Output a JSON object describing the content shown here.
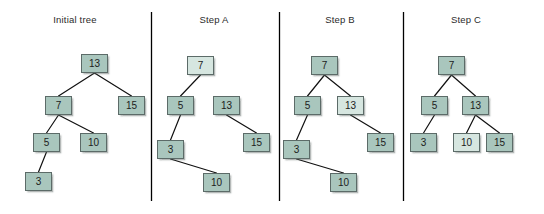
{
  "diagram": {
    "background_color": "#ffffff",
    "node_fill": "#a9c6bd",
    "node_fill_highlight": "#d6e6e0",
    "node_border": "#5c6b68",
    "edge_color": "#111111",
    "divider_color": "#000000",
    "text_color": "#2b2b2b"
  },
  "dividers": [
    {
      "x": 151,
      "y1": 12,
      "y2": 201
    },
    {
      "x": 279,
      "y1": 12,
      "y2": 201
    },
    {
      "x": 403,
      "y1": 12,
      "y2": 201
    }
  ],
  "panels": [
    {
      "id": "initial-tree",
      "title": "Initial tree",
      "title_x": 75,
      "title_y": 14,
      "nodes": [
        {
          "id": "n13",
          "label": "13",
          "x": 81,
          "y": 54,
          "highlight": false
        },
        {
          "id": "n7",
          "label": "7",
          "x": 45,
          "y": 96,
          "highlight": false
        },
        {
          "id": "n15",
          "label": "15",
          "x": 118,
          "y": 96,
          "highlight": false
        },
        {
          "id": "n5",
          "label": "5",
          "x": 33,
          "y": 133,
          "highlight": false
        },
        {
          "id": "n10",
          "label": "10",
          "x": 80,
          "y": 133,
          "highlight": false
        },
        {
          "id": "n3",
          "label": "3",
          "x": 25,
          "y": 172,
          "highlight": false
        }
      ],
      "edges": [
        {
          "from": "n13",
          "to": "n7"
        },
        {
          "from": "n13",
          "to": "n15"
        },
        {
          "from": "n7",
          "to": "n5"
        },
        {
          "from": "n7",
          "to": "n10"
        },
        {
          "from": "n5",
          "to": "n3"
        }
      ]
    },
    {
      "id": "step-a",
      "title": "Step A",
      "title_x": 214,
      "title_y": 14,
      "nodes": [
        {
          "id": "n7",
          "label": "7",
          "x": 187,
          "y": 56,
          "highlight": true
        },
        {
          "id": "n5",
          "label": "5",
          "x": 167,
          "y": 96,
          "highlight": false
        },
        {
          "id": "n13",
          "label": "13",
          "x": 213,
          "y": 96,
          "highlight": false
        },
        {
          "id": "n3",
          "label": "3",
          "x": 157,
          "y": 140,
          "highlight": false
        },
        {
          "id": "n15",
          "label": "15",
          "x": 243,
          "y": 133,
          "highlight": false
        },
        {
          "id": "n10",
          "label": "10",
          "x": 203,
          "y": 173,
          "highlight": false
        }
      ],
      "edges": [
        {
          "from": "n7",
          "to": "n5"
        },
        {
          "from": "n5",
          "to": "n3"
        },
        {
          "from": "n13",
          "to": "n15"
        },
        {
          "from": "n3",
          "to": "n10"
        }
      ]
    },
    {
      "id": "step-b",
      "title": "Step B",
      "title_x": 340,
      "title_y": 14,
      "nodes": [
        {
          "id": "n7",
          "label": "7",
          "x": 311,
          "y": 56,
          "highlight": false
        },
        {
          "id": "n5",
          "label": "5",
          "x": 294,
          "y": 96,
          "highlight": false
        },
        {
          "id": "n13",
          "label": "13",
          "x": 337,
          "y": 96,
          "highlight": true
        },
        {
          "id": "n3",
          "label": "3",
          "x": 283,
          "y": 140,
          "highlight": false
        },
        {
          "id": "n15",
          "label": "15",
          "x": 367,
          "y": 133,
          "highlight": false
        },
        {
          "id": "n10",
          "label": "10",
          "x": 330,
          "y": 173,
          "highlight": false
        }
      ],
      "edges": [
        {
          "from": "n7",
          "to": "n5"
        },
        {
          "from": "n7",
          "to": "n13"
        },
        {
          "from": "n5",
          "to": "n3"
        },
        {
          "from": "n13",
          "to": "n15"
        },
        {
          "from": "n3",
          "to": "n10"
        }
      ]
    },
    {
      "id": "step-c",
      "title": "Step C",
      "title_x": 466,
      "title_y": 14,
      "nodes": [
        {
          "id": "n7",
          "label": "7",
          "x": 438,
          "y": 56,
          "highlight": false
        },
        {
          "id": "n5",
          "label": "5",
          "x": 421,
          "y": 96,
          "highlight": false
        },
        {
          "id": "n13",
          "label": "13",
          "x": 462,
          "y": 96,
          "highlight": false
        },
        {
          "id": "n3",
          "label": "3",
          "x": 410,
          "y": 133,
          "highlight": false
        },
        {
          "id": "n10",
          "label": "10",
          "x": 453,
          "y": 133,
          "highlight": true
        },
        {
          "id": "n15",
          "label": "15",
          "x": 486,
          "y": 133,
          "highlight": false
        }
      ],
      "edges": [
        {
          "from": "n7",
          "to": "n5"
        },
        {
          "from": "n7",
          "to": "n13"
        },
        {
          "from": "n5",
          "to": "n3"
        },
        {
          "from": "n13",
          "to": "n10"
        },
        {
          "from": "n13",
          "to": "n15"
        }
      ]
    }
  ]
}
